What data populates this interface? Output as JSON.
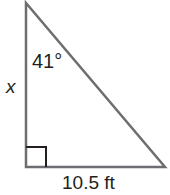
{
  "diagram": {
    "type": "right-triangle",
    "vertices": {
      "top": [
        26,
        3
      ],
      "right_angle": [
        26,
        167
      ],
      "bottom_right": [
        165,
        167
      ]
    },
    "right_angle_marker_size": 20,
    "stroke_color": "#6d6e71",
    "marker_color": "#231f20",
    "labels": {
      "angle": "41°",
      "vertical_side": "x",
      "base": "10.5 ft"
    }
  }
}
